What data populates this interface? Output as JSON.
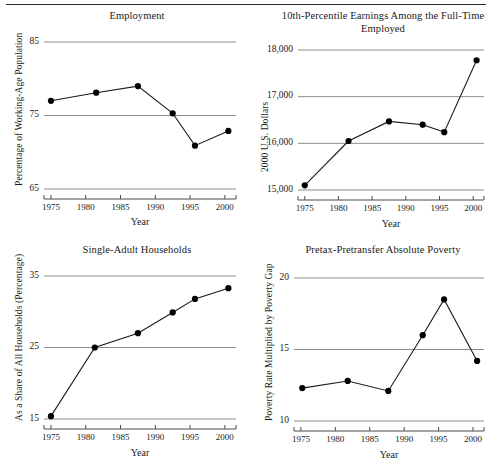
{
  "figure": {
    "axis_title": "Year",
    "grid": true,
    "gridline_color": "#8c8c8c",
    "axis_color": "#4a4a4a",
    "line_color": "#1a1a1a",
    "marker_color": "#000000"
  },
  "chart_data": [
    {
      "type": "line",
      "title": "Employment",
      "xlabel": "Year",
      "ylabel": "Percentage of Working-Age Population",
      "xlim": [
        1974.0,
        2001.6
      ],
      "ylim": [
        65,
        85
      ],
      "xticks": [
        1975,
        1980,
        1985,
        1990,
        1995,
        2000
      ],
      "yticks": [
        65,
        75,
        85
      ],
      "x": [
        1975.0,
        1981.5,
        1987.5,
        1992.5,
        1995.7,
        2000.5
      ],
      "values": [
        77.0,
        78.1,
        79.0,
        75.3,
        70.9,
        72.9
      ]
    },
    {
      "type": "line",
      "title": "10th-Percentile Earnings Among the Full-Time Employed",
      "xlabel": "Year",
      "ylabel": "2000 U.S. Dollars",
      "xlim": [
        1974.0,
        2001.6
      ],
      "ylim": [
        15000,
        18000
      ],
      "xticks": [
        1975,
        1980,
        1985,
        1990,
        1995,
        2000
      ],
      "yticks": [
        15000,
        16000,
        17000,
        18000
      ],
      "ytick_labels": [
        "15,000",
        "16,000",
        "17,000",
        "18,000"
      ],
      "x": [
        1975.0,
        1981.5,
        1987.5,
        1992.5,
        1995.7,
        2000.5
      ],
      "values": [
        15100,
        16050,
        16470,
        16400,
        16240,
        17780
      ]
    },
    {
      "type": "line",
      "title": "Single-Adult Households",
      "xlabel": "Year",
      "ylabel": "As a Share of All Households (Percentage)",
      "xlim": [
        1974.0,
        2001.6
      ],
      "ylim": [
        15,
        35
      ],
      "xticks": [
        1975,
        1980,
        1985,
        1990,
        1995,
        2000
      ],
      "yticks": [
        15,
        25,
        35
      ],
      "x": [
        1975.0,
        1981.3,
        1987.5,
        1992.5,
        1995.7,
        2000.5
      ],
      "values": [
        15.4,
        25.0,
        27.0,
        29.9,
        31.8,
        33.3
      ]
    },
    {
      "type": "line",
      "title": "Pretax-Pretransfer Absolute Poverty",
      "xlabel": "Year",
      "ylabel": "Poverty Rate Multiplied by Poverty Gap",
      "xlim": [
        1974.0,
        2001.6
      ],
      "ylim": [
        10,
        20
      ],
      "xticks": [
        1975,
        1980,
        1985,
        1990,
        1995,
        2000
      ],
      "yticks": [
        10,
        15,
        20
      ],
      "x": [
        1975.2,
        1981.8,
        1987.7,
        1992.7,
        1995.8,
        2000.6
      ],
      "values": [
        12.3,
        12.8,
        12.1,
        16.0,
        18.5,
        14.2
      ]
    }
  ]
}
